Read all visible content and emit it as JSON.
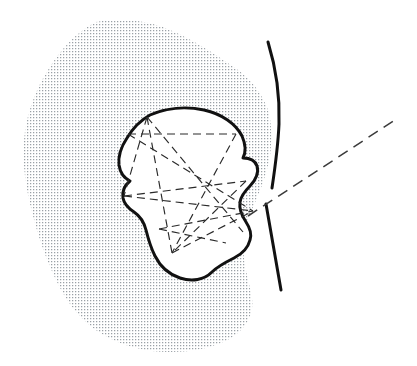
{
  "figure": {
    "kind": "line-art-diagram",
    "canvas": {
      "width": 417,
      "height": 366,
      "background": "#ffffff"
    },
    "colors": {
      "background": "#ffffff",
      "stipple_dot": "#9aa0a6",
      "stipple_field": "#ffffff",
      "outline": "#111111",
      "inner_fill": "#ffffff",
      "dashed_line": "#2a2a2a",
      "axis_ray": "#3a3a3a"
    },
    "stipple": {
      "name": "stippled-matrix-region",
      "description": "Irregular amorphous shaded blob filling the left and central portion of the frame",
      "dot_spacing_px": 3,
      "dot_size_px": 1,
      "path": "M 96 22 C 120 18 148 20 170 30 C 196 41 218 56 238 70 C 252 80 262 94 268 110 C 272 124 272 140 270 156 C 266 178 258 196 250 214 C 244 228 242 244 244 258 C 246 274 250 286 252 298 C 254 312 248 326 234 336 C 216 348 192 352 170 352 C 146 352 122 346 102 334 C 82 322 68 304 58 284 C 46 260 38 236 32 212 C 26 188 22 164 24 140 C 26 116 34 92 48 70 C 60 50 76 32 96 22 Z"
    },
    "inner_body": {
      "name": "inner-white-body",
      "description": "White irregular closed contour with a heavy black outline, set inside the stippled field",
      "outline_width_px": 3,
      "path": "M 150 115 C 166 108 186 106 204 110 C 222 114 236 124 242 136 C 246 145 246 152 243 158 C 249 158 255 160 257 166 C 259 172 256 180 250 186 C 245 191 241 196 240 202 C 239 209 242 216 246 222 C 250 228 252 234 250 240 C 248 248 242 254 234 258 C 226 262 218 266 212 272 C 204 280 192 282 180 278 C 168 274 160 266 155 256 C 150 246 148 238 146 230 C 144 222 140 216 134 212 C 128 208 124 204 123 198 C 122 191 125 185 130 181 C 124 178 120 172 119 165 C 118 156 121 147 127 138 C 133 128 141 120 150 115 Z"
    },
    "right_boundary_upper": {
      "name": "upper-right-boundary-curve",
      "description": "Tall curved black stroke marking the right-hand edge of the stippled field above the notch",
      "width_px": 3,
      "path": "M 268 42 C 276 68 280 96 279 124 C 278 148 275 168 272 188"
    },
    "right_boundary_lower": {
      "name": "lower-right-boundary-curve",
      "description": "Short curved black stroke forming the lower right tail below the notch gap",
      "width_px": 3,
      "path": "M 266 204 C 270 228 275 256 281 290"
    },
    "notch": {
      "name": "boundary-notch-gap",
      "description": "Open gap between the upper and lower right boundary curves where the dashed ray passes through",
      "apex_x": 253,
      "apex_y": 211
    },
    "axis_ray": {
      "name": "long-axis-dashed-ray",
      "description": "Long dashed straight ray running from the notch apex out to the upper right corner of the frame",
      "from": [
        248,
        216
      ],
      "to": [
        398,
        118
      ],
      "dash": "11 7"
    },
    "measurement_chords": {
      "name": "dashed-measurement-chords",
      "description": "Network of dashed straight chords spanning the inner white body between boundary landmark points",
      "dash": "8 5",
      "landmarks": [
        {
          "id": "A",
          "label": "top-left-vertex",
          "x": 147,
          "y": 117
        },
        {
          "id": "B",
          "label": "left-upper-vertex",
          "x": 128,
          "y": 134
        },
        {
          "id": "C",
          "label": "left-waist-vertex",
          "x": 124,
          "y": 196
        },
        {
          "id": "D",
          "label": "bottom-left-vertex",
          "x": 172,
          "y": 253
        },
        {
          "id": "E",
          "label": "bottom-mid-vertex",
          "x": 159,
          "y": 229
        },
        {
          "id": "F",
          "label": "right-upper-vertex",
          "x": 236,
          "y": 134
        },
        {
          "id": "G",
          "label": "right-mid-vertex",
          "x": 246,
          "y": 181
        },
        {
          "id": "H",
          "label": "notch-apex",
          "x": 253,
          "y": 211
        },
        {
          "id": "I",
          "label": "right-lower-vertex",
          "x": 243,
          "y": 232
        },
        {
          "id": "J",
          "label": "bottom-right-vertex",
          "x": 226,
          "y": 243
        }
      ],
      "chords": [
        {
          "name": "chord-B-F",
          "from": "B",
          "to": "F"
        },
        {
          "name": "chord-A-C",
          "from": "A",
          "to": "C"
        },
        {
          "name": "chord-A-D",
          "from": "A",
          "to": "D"
        },
        {
          "name": "chord-A-I",
          "from": "A",
          "to": "I"
        },
        {
          "name": "chord-B-H",
          "from": "B",
          "to": "H"
        },
        {
          "name": "chord-C-G",
          "from": "C",
          "to": "G"
        },
        {
          "name": "chord-C-H",
          "from": "C",
          "to": "H"
        },
        {
          "name": "chord-F-D",
          "from": "F",
          "to": "D"
        },
        {
          "name": "chord-G-D",
          "from": "G",
          "to": "D"
        },
        {
          "name": "chord-E-J",
          "from": "E",
          "to": "J"
        },
        {
          "name": "chord-E-H",
          "from": "E",
          "to": "H"
        },
        {
          "name": "chord-D-H",
          "from": "D",
          "to": "H"
        }
      ]
    }
  }
}
